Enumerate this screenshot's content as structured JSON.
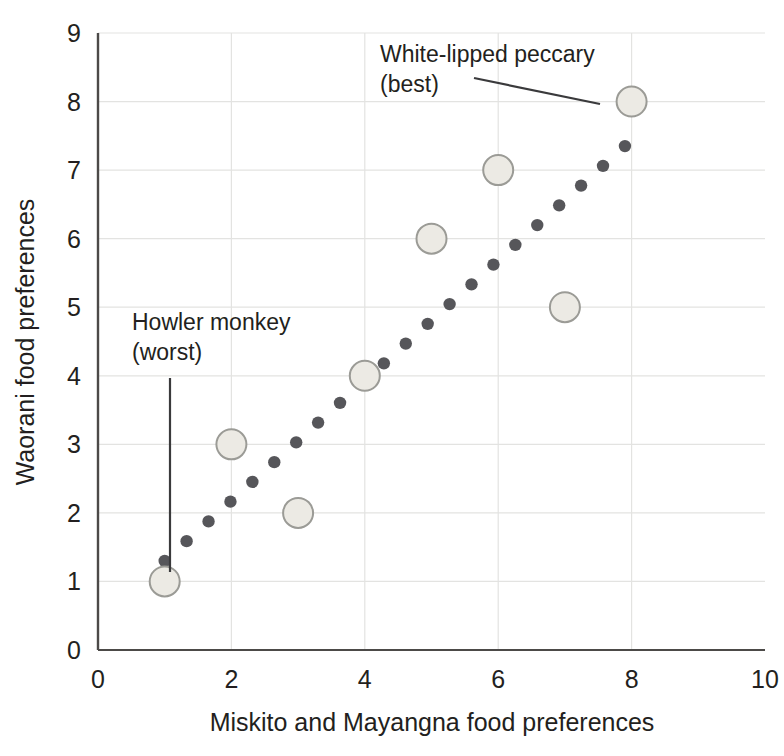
{
  "chart_data": {
    "type": "scatter",
    "title": "",
    "subtitle": "",
    "xlabel": "Miskito and Mayangna food preferences",
    "ylabel": "Waorani food preferences",
    "xlim": [
      0,
      10
    ],
    "ylim": [
      0,
      9
    ],
    "xticks": [
      "0",
      "2",
      "4",
      "6",
      "8",
      "10"
    ],
    "xtick_values": [
      0,
      2,
      4,
      6,
      8,
      10
    ],
    "yticks": [
      "0",
      "1",
      "2",
      "3",
      "4",
      "5",
      "6",
      "7",
      "8",
      "9"
    ],
    "ytick_values": [
      0,
      1,
      2,
      3,
      4,
      5,
      6,
      7,
      8,
      9
    ],
    "grid": "both-light-gray",
    "legend": "none",
    "points": [
      {
        "x": 1,
        "y": 1,
        "label": "Howler monkey (worst)"
      },
      {
        "x": 2,
        "y": 3,
        "label": ""
      },
      {
        "x": 3,
        "y": 2,
        "label": ""
      },
      {
        "x": 4,
        "y": 4,
        "label": ""
      },
      {
        "x": 5,
        "y": 6,
        "label": ""
      },
      {
        "x": 6,
        "y": 7,
        "label": ""
      },
      {
        "x": 7,
        "y": 5,
        "label": ""
      },
      {
        "x": 8,
        "y": 8,
        "label": "White-lipped peccary (best)"
      }
    ],
    "trendline": {
      "style": "dotted",
      "x_start": 1.0,
      "y_start": 1.3,
      "x_end": 7.9,
      "y_end": 7.35,
      "dot_count": 22
    },
    "annotations": [
      {
        "id": "peccary",
        "line1": "White-lipped peccary",
        "line2": "(best)",
        "text_x": 380,
        "text_y": 62,
        "leader_from_x": 474,
        "leader_from_y": 78,
        "leader_to_x": 600,
        "leader_to_y": 104
      },
      {
        "id": "howler",
        "line1": "Howler monkey",
        "line2": "(worst)",
        "text_x": 132,
        "text_y": 330,
        "leader_from_x": 170,
        "leader_from_y": 378,
        "leader_to_x": 170,
        "leader_to_y": 572
      }
    ],
    "colors": {
      "marker_fill": "#eceae4",
      "marker_stroke": "#9b9b96",
      "trendline_dot": "#56565a",
      "grid": "#e3e3e1",
      "axis": "#4c4a48",
      "text": "#231f20",
      "background": "#ffffff"
    }
  }
}
